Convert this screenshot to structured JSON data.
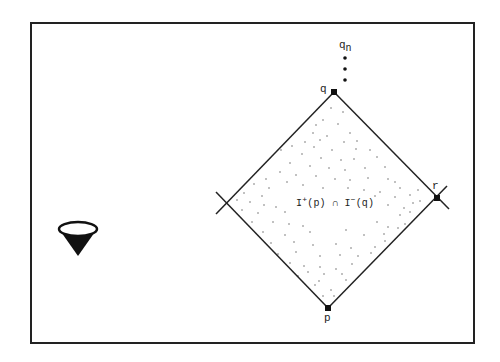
{
  "diagram": {
    "frame": {
      "x": 30,
      "y": 22,
      "width": 443,
      "height": 320,
      "stroke": "#222222"
    },
    "points": {
      "q": {
        "x": 334,
        "y": 92,
        "label": "q"
      },
      "p": {
        "x": 328,
        "y": 308,
        "label": "p"
      },
      "r": {
        "x": 437,
        "y": 198,
        "label": "r"
      },
      "left": {
        "x": 226,
        "y": 203
      }
    },
    "labels": {
      "q": "q",
      "p": "p",
      "r": "r",
      "qn_base": "q",
      "qn_sub": "n",
      "region": {
        "I1": "I",
        "sup1": "+",
        "arg1": "(p)",
        "cap": "∩",
        "I2": "I",
        "sup2": "−",
        "arg2": "(q)"
      }
    },
    "sequence_dots": [
      {
        "x": 345,
        "y": 58
      },
      {
        "x": 345,
        "y": 69
      },
      {
        "x": 345,
        "y": 80
      }
    ],
    "light_cone_icon": {
      "cx": 78,
      "cy": 229,
      "rx": 19,
      "ry": 7,
      "tip_x": 78,
      "tip_y": 256,
      "name": "light-cone"
    },
    "line_color": "#222222",
    "scatter_dots": [
      [
        331,
        108
      ],
      [
        343,
        112
      ],
      [
        323,
        120
      ],
      [
        316,
        125
      ],
      [
        338,
        124
      ],
      [
        313,
        133
      ],
      [
        327,
        136
      ],
      [
        350,
        133
      ],
      [
        305,
        142
      ],
      [
        320,
        140
      ],
      [
        344,
        142
      ],
      [
        357,
        141
      ],
      [
        292,
        146
      ],
      [
        314,
        147
      ],
      [
        332,
        150
      ],
      [
        356,
        149
      ],
      [
        370,
        150
      ],
      [
        281,
        150
      ],
      [
        302,
        154
      ],
      [
        321,
        158
      ],
      [
        341,
        160
      ],
      [
        354,
        159
      ],
      [
        377,
        157
      ],
      [
        290,
        163
      ],
      [
        310,
        166
      ],
      [
        329,
        168
      ],
      [
        345,
        170
      ],
      [
        365,
        168
      ],
      [
        385,
        167
      ],
      [
        280,
        172
      ],
      [
        296,
        175
      ],
      [
        316,
        176
      ],
      [
        335,
        179
      ],
      [
        350,
        180
      ],
      [
        368,
        178
      ],
      [
        388,
        179
      ],
      [
        395,
        182
      ],
      [
        266,
        179
      ],
      [
        287,
        182
      ],
      [
        303,
        185
      ],
      [
        323,
        188
      ],
      [
        348,
        188
      ],
      [
        364,
        190
      ],
      [
        380,
        192
      ],
      [
        400,
        188
      ],
      [
        254,
        184
      ],
      [
        269,
        188
      ],
      [
        244,
        193
      ],
      [
        262,
        196
      ],
      [
        375,
        196
      ],
      [
        395,
        197
      ],
      [
        410,
        195
      ],
      [
        418,
        190
      ],
      [
        237,
        200
      ],
      [
        250,
        202
      ],
      [
        264,
        205
      ],
      [
        276,
        207
      ],
      [
        300,
        205
      ],
      [
        388,
        205
      ],
      [
        404,
        208
      ],
      [
        420,
        201
      ],
      [
        242,
        210
      ],
      [
        258,
        213
      ],
      [
        285,
        212
      ],
      [
        400,
        215
      ],
      [
        410,
        212
      ],
      [
        413,
        203
      ],
      [
        252,
        222
      ],
      [
        273,
        222
      ],
      [
        289,
        224
      ],
      [
        303,
        226
      ],
      [
        377,
        222
      ],
      [
        388,
        227
      ],
      [
        405,
        224
      ],
      [
        263,
        232
      ],
      [
        285,
        235
      ],
      [
        310,
        232
      ],
      [
        346,
        230
      ],
      [
        364,
        235
      ],
      [
        384,
        234
      ],
      [
        398,
        228
      ],
      [
        271,
        243
      ],
      [
        294,
        242
      ],
      [
        313,
        245
      ],
      [
        336,
        244
      ],
      [
        351,
        248
      ],
      [
        375,
        247
      ],
      [
        385,
        241
      ],
      [
        278,
        254
      ],
      [
        296,
        252
      ],
      [
        320,
        256
      ],
      [
        340,
        255
      ],
      [
        358,
        256
      ],
      [
        371,
        253
      ],
      [
        290,
        263
      ],
      [
        304,
        266
      ],
      [
        320,
        267
      ],
      [
        336,
        269
      ],
      [
        352,
        264
      ],
      [
        298,
        276
      ],
      [
        308,
        272
      ],
      [
        324,
        274
      ],
      [
        342,
        274
      ],
      [
        346,
        280
      ],
      [
        315,
        285
      ],
      [
        319,
        281
      ],
      [
        331,
        290
      ],
      [
        323,
        296
      ],
      [
        334,
        296
      ]
    ]
  }
}
